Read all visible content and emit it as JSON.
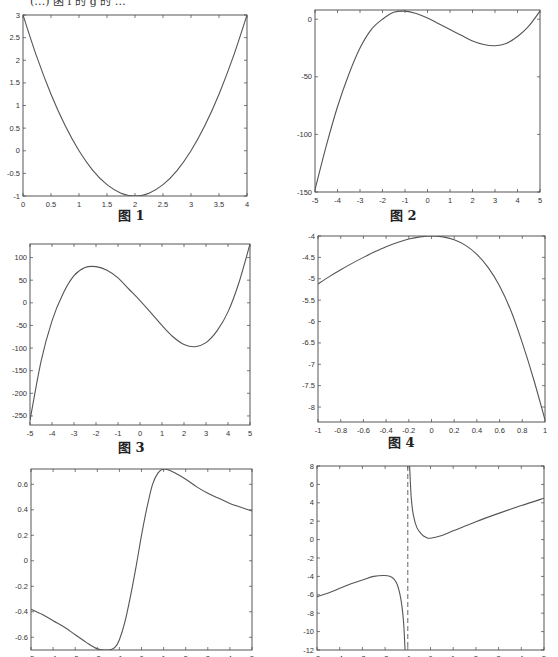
{
  "header": {
    "partial_text": "(…) 函 f 的 g 的 …"
  },
  "captions": [
    "图 1",
    "图 2",
    "图 3",
    "图 4"
  ],
  "chart_data": [
    {
      "type": "line",
      "caption": "图 1",
      "title": "",
      "xlabel": "",
      "ylabel": "",
      "xlim": [
        0,
        4
      ],
      "ylim": [
        -1,
        3
      ],
      "xticks": [
        0,
        0.5,
        1,
        1.5,
        2,
        2.5,
        3,
        3.5,
        4
      ],
      "yticks": [
        -1,
        -0.5,
        0,
        0.5,
        1,
        1.5,
        2,
        2.5,
        3
      ],
      "grid": false,
      "x": [
        0,
        0.25,
        0.5,
        0.75,
        1,
        1.25,
        1.5,
        1.75,
        2,
        2.25,
        2.5,
        2.75,
        3,
        3.25,
        3.5,
        3.75,
        4
      ],
      "y": [
        3,
        2.0625,
        1.25,
        0.5625,
        0,
        -0.4375,
        -0.75,
        -0.9375,
        -1,
        -0.9375,
        -0.75,
        -0.4375,
        0,
        0.5625,
        1.25,
        2.0625,
        3
      ]
    },
    {
      "type": "line",
      "caption": "图 2",
      "title": "",
      "xlabel": "",
      "ylabel": "",
      "xlim": [
        -5,
        5
      ],
      "ylim": [
        -150,
        8
      ],
      "xticks": [
        -5,
        -4,
        -3,
        -2,
        -1,
        0,
        1,
        2,
        3,
        4,
        5
      ],
      "yticks": [
        -150,
        -100,
        -50,
        0
      ],
      "grid": false,
      "x": [
        -5,
        -4.5,
        -4,
        -3.5,
        -3,
        -2.5,
        -2,
        -1.5,
        -1,
        -0.5,
        0,
        0.5,
        1,
        1.5,
        2,
        2.5,
        3,
        3.5,
        4,
        4.5,
        5
      ],
      "y": [
        -148,
        -110,
        -76,
        -48,
        -25,
        -9,
        0,
        6,
        7,
        5,
        1,
        -4,
        -9,
        -14,
        -19,
        -22,
        -23,
        -21,
        -15,
        -6,
        7
      ]
    },
    {
      "type": "line",
      "caption": "图 3",
      "title": "",
      "xlabel": "",
      "ylabel": "",
      "xlim": [
        -5,
        5
      ],
      "ylim": [
        -270,
        130
      ],
      "xticks": [
        -5,
        -4,
        -3,
        -2,
        -1,
        0,
        1,
        2,
        3,
        4,
        5
      ],
      "yticks": [
        -250,
        -200,
        -150,
        -100,
        -50,
        0,
        50,
        100
      ],
      "grid": false,
      "x": [
        -5,
        -4.5,
        -4,
        -3.5,
        -3,
        -2.5,
        -2,
        -1.5,
        -1,
        -0.5,
        0,
        0.5,
        1,
        1.5,
        2,
        2.5,
        3,
        3.5,
        4,
        4.5,
        5
      ],
      "y": [
        -260,
        -130,
        -40,
        20,
        60,
        78,
        80,
        72,
        55,
        30,
        5,
        -22,
        -50,
        -75,
        -92,
        -97,
        -88,
        -62,
        -20,
        45,
        130
      ]
    },
    {
      "type": "line",
      "caption": "图 4",
      "title": "",
      "xlabel": "",
      "ylabel": "",
      "xlim": [
        -1,
        1
      ],
      "ylim": [
        -8.35,
        -4
      ],
      "xticks": [
        -1,
        -0.8,
        -0.6,
        -0.4,
        -0.2,
        0,
        0.2,
        0.4,
        0.6,
        0.8,
        1
      ],
      "yticks": [
        -8,
        -7.5,
        -7,
        -6.5,
        -6,
        -5.5,
        -5,
        -4.5,
        -4
      ],
      "grid": false,
      "x": [
        -1,
        -0.9,
        -0.8,
        -0.7,
        -0.6,
        -0.5,
        -0.4,
        -0.3,
        -0.2,
        -0.1,
        0,
        0.1,
        0.2,
        0.3,
        0.4,
        0.5,
        0.6,
        0.7,
        0.8,
        0.9,
        1
      ],
      "y": [
        -5.12,
        -4.95,
        -4.79,
        -4.64,
        -4.5,
        -4.37,
        -4.25,
        -4.15,
        -4.07,
        -4.02,
        -4.0,
        -4.02,
        -4.09,
        -4.22,
        -4.43,
        -4.74,
        -5.17,
        -5.75,
        -6.5,
        -7.35,
        -8.3
      ]
    },
    {
      "type": "line",
      "caption": "",
      "title": "",
      "xlabel": "",
      "ylabel": "",
      "xlim": [
        -5,
        5
      ],
      "ylim": [
        -0.7,
        0.72
      ],
      "xticks": [
        -5,
        -4,
        -3,
        -2,
        -1,
        0,
        1,
        2,
        3,
        4,
        5
      ],
      "yticks": [
        -0.6,
        -0.4,
        -0.2,
        0,
        0.2,
        0.4,
        0.6
      ],
      "grid": false,
      "x": [
        -5,
        -4.5,
        -4,
        -3.5,
        -3,
        -2.5,
        -2,
        -1.5,
        -1.2,
        -1,
        -0.75,
        -0.5,
        -0.25,
        0,
        0.25,
        0.5,
        0.75,
        1,
        1.25,
        1.5,
        2,
        2.5,
        3,
        3.5,
        4,
        4.5,
        5
      ],
      "y": [
        -0.38,
        -0.42,
        -0.47,
        -0.52,
        -0.58,
        -0.64,
        -0.69,
        -0.7,
        -0.68,
        -0.62,
        -0.48,
        -0.28,
        -0.05,
        0.2,
        0.42,
        0.6,
        0.69,
        0.72,
        0.71,
        0.69,
        0.64,
        0.58,
        0.53,
        0.49,
        0.45,
        0.42,
        0.39
      ]
    },
    {
      "type": "line",
      "caption": "",
      "title": "",
      "xlabel": "",
      "ylabel": "",
      "xlim": [
        -5,
        5
      ],
      "ylim": [
        -12,
        8
      ],
      "xticks": [
        -5,
        -4,
        -3,
        -2,
        -1,
        0,
        1,
        2,
        3,
        4,
        5
      ],
      "yticks": [
        -12,
        -10,
        -8,
        -6,
        -4,
        -2,
        0,
        2,
        4,
        6,
        8
      ],
      "grid": false,
      "asymptote": {
        "x": -1,
        "style": "dashed"
      },
      "series": [
        {
          "name": "left-branch",
          "x": [
            -5,
            -4.5,
            -4,
            -3.5,
            -3,
            -2.5,
            -2,
            -1.7,
            -1.5,
            -1.35,
            -1.25,
            -1.18,
            -1.12
          ],
          "y": [
            -6.2,
            -5.8,
            -5.3,
            -4.8,
            -4.4,
            -4.0,
            -3.9,
            -4.1,
            -4.7,
            -5.9,
            -7.4,
            -9.2,
            -12
          ]
        },
        {
          "name": "right-branch",
          "x": [
            -0.92,
            -0.85,
            -0.75,
            -0.6,
            -0.4,
            -0.2,
            0,
            0.5,
            1,
            2,
            3,
            4,
            5
          ],
          "y": [
            8,
            4.6,
            2.6,
            1.3,
            0.6,
            0.25,
            0.15,
            0.45,
            0.95,
            1.95,
            2.85,
            3.7,
            4.5
          ]
        }
      ]
    }
  ]
}
